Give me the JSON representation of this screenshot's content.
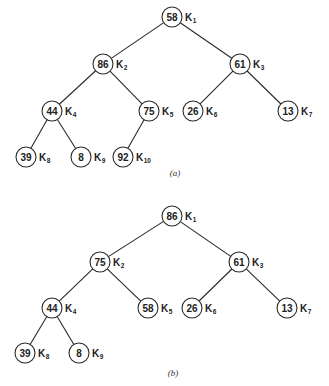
{
  "diagrams": [
    {
      "caption": "(a)",
      "caption_pos": [
        175,
        176
      ],
      "nodes": [
        {
          "id": "K1",
          "value": "58",
          "label": "K",
          "sub": "1",
          "x": 172,
          "y": 17
        },
        {
          "id": "K2",
          "value": "86",
          "label": "K",
          "sub": "2",
          "x": 103,
          "y": 64
        },
        {
          "id": "K3",
          "value": "61",
          "label": "K",
          "sub": "3",
          "x": 240,
          "y": 64
        },
        {
          "id": "K4",
          "value": "44",
          "label": "K",
          "sub": "4",
          "x": 52,
          "y": 111
        },
        {
          "id": "K5",
          "value": "75",
          "label": "K",
          "sub": "5",
          "x": 149,
          "y": 111
        },
        {
          "id": "K6",
          "value": "26",
          "label": "K",
          "sub": "6",
          "x": 193,
          "y": 111
        },
        {
          "id": "K7",
          "value": "13",
          "label": "K",
          "sub": "7",
          "x": 288,
          "y": 111
        },
        {
          "id": "K8",
          "value": "39",
          "label": "K",
          "sub": "8",
          "x": 26,
          "y": 157
        },
        {
          "id": "K9",
          "value": "8",
          "label": "K",
          "sub": "9",
          "x": 81,
          "y": 157
        },
        {
          "id": "K10",
          "value": "92",
          "label": "K",
          "sub": "10",
          "x": 123,
          "y": 157
        }
      ],
      "edges": [
        [
          "K1",
          "K2"
        ],
        [
          "K1",
          "K3"
        ],
        [
          "K2",
          "K4"
        ],
        [
          "K2",
          "K5"
        ],
        [
          "K3",
          "K6"
        ],
        [
          "K3",
          "K7"
        ],
        [
          "K4",
          "K8"
        ],
        [
          "K4",
          "K9"
        ],
        [
          "K5",
          "K10"
        ]
      ]
    },
    {
      "caption": "(b)",
      "caption_pos": [
        173,
        376
      ],
      "nodes": [
        {
          "id": "K1",
          "value": "86",
          "label": "K",
          "sub": "1",
          "x": 172,
          "y": 216
        },
        {
          "id": "K2",
          "value": "75",
          "label": "K",
          "sub": "2",
          "x": 100,
          "y": 262
        },
        {
          "id": "K3",
          "value": "61",
          "label": "K",
          "sub": "3",
          "x": 239,
          "y": 262
        },
        {
          "id": "K4",
          "value": "44",
          "label": "K",
          "sub": "4",
          "x": 52,
          "y": 308
        },
        {
          "id": "K5",
          "value": "58",
          "label": "K",
          "sub": "5",
          "x": 148,
          "y": 308
        },
        {
          "id": "K6",
          "value": "26",
          "label": "K",
          "sub": "6",
          "x": 192,
          "y": 308
        },
        {
          "id": "K7",
          "value": "13",
          "label": "K",
          "sub": "7",
          "x": 287,
          "y": 308
        },
        {
          "id": "K8",
          "value": "39",
          "label": "K",
          "sub": "8",
          "x": 25,
          "y": 353
        },
        {
          "id": "K9",
          "value": "8",
          "label": "K",
          "sub": "9",
          "x": 79,
          "y": 353
        }
      ],
      "edges": [
        [
          "K1",
          "K2"
        ],
        [
          "K1",
          "K3"
        ],
        [
          "K2",
          "K4"
        ],
        [
          "K2",
          "K5"
        ],
        [
          "K3",
          "K6"
        ],
        [
          "K3",
          "K7"
        ],
        [
          "K4",
          "K8"
        ],
        [
          "K4",
          "K9"
        ]
      ]
    }
  ],
  "style": {
    "node_radius": 10,
    "line_color": "#2a2a2a",
    "background": "#ffffff"
  }
}
